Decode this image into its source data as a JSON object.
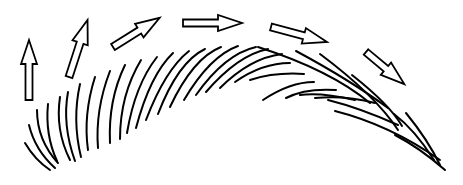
{
  "diagram": {
    "stroke_color": "#000000",
    "background": "#ffffff",
    "arrows": [
      {
        "name": "arrow-1-up",
        "x": 29,
        "y": 100,
        "angle": -90,
        "length": 60
      },
      {
        "name": "arrow-2-up-right",
        "x": 69,
        "y": 77,
        "angle": -72,
        "length": 60
      },
      {
        "name": "arrow-3-up-right",
        "x": 113,
        "y": 47,
        "angle": -32,
        "length": 55
      },
      {
        "name": "arrow-4-right",
        "x": 183,
        "y": 23,
        "angle": 0,
        "length": 59
      },
      {
        "name": "arrow-5-down-right",
        "x": 271,
        "y": 27,
        "angle": 15,
        "length": 58
      },
      {
        "name": "arrow-6-down-right",
        "x": 366,
        "y": 52,
        "angle": 40,
        "length": 50
      }
    ],
    "streaks": [
      "M 25 143 Q 35 160 50 170",
      "M 29 125 Q 35 150 55 168",
      "M 37 110 Q 37 140 58 163",
      "M 48 104 Q 45 135 57 161",
      "M 60 97 Q 55 130 70 160",
      "M 68 92 Q 62 125 75 161",
      "M 80 84 Q 72 120 81 157",
      "M 95 77 Q 83 115 88 150",
      "M 110 71 Q 95 110 98 148",
      "M 125 65 Q 108 100 110 143",
      "M 141 60 Q 120 95 120 139",
      "M 157 57 Q 135 85 127 133",
      "M 173 53 Q 150 75 136 128",
      "M 189 51 Q 165 70 146 120",
      "M 205 49 Q 178 62 158 114",
      "M 221 47 Q 193 58 170 107",
      "M 238 46 Q 210 56 184 100",
      "M 256 47 Q 225 54 196 95",
      "M 268 49 Q 238 55 206 92",
      "M 282 54 Q 250 58 220 88",
      "M 290 63 Q 262 63 235 82",
      "M 304 74 Q 275 72 250 80",
      "M 314 82 Q 290 82 263 100",
      "M 336 90 Q 305 88 286 98",
      "M 355 100 Q 320 92 300 95",
      "M 375 103 Q 345 95 315 98",
      "M 398 125 Q 360 108 328 100"
    ],
    "long_streaks": [
      "M 258 47 Q 330 70 370 103",
      "M 296 51 Q 350 80 388 108",
      "M 320 54 Q 375 95 398 130",
      "M 352 75 Q 390 105 402 126",
      "M 394 114 Q 415 130 434 160",
      "M 406 113 Q 428 140 440 165",
      "M 335 111 Q 390 125 440 160",
      "M 395 135 Q 420 148 445 170"
    ]
  }
}
